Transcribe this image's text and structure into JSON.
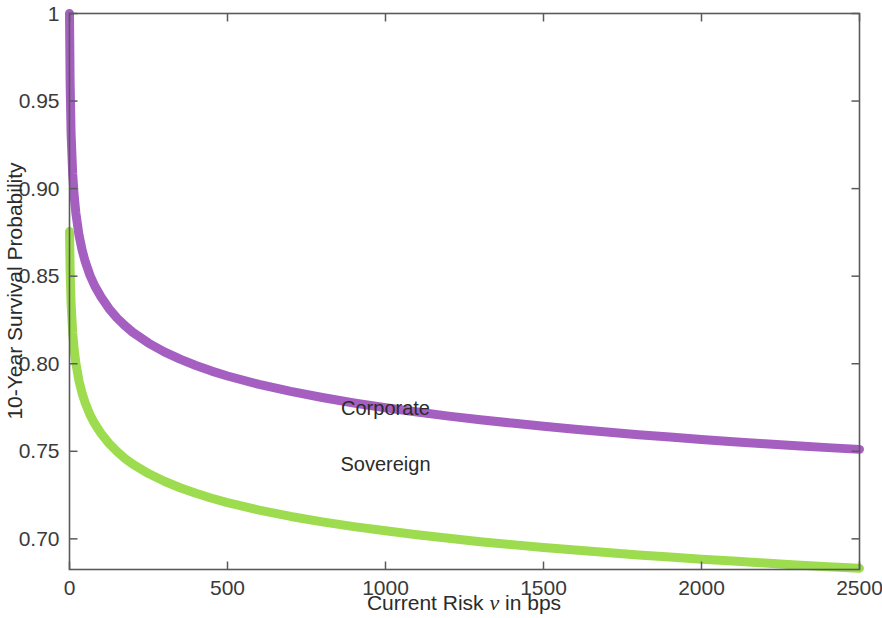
{
  "chart_data": {
    "type": "line",
    "title": "",
    "xlabel": "Current Risk ν in bps",
    "xlabel_prefix": "Current Risk ",
    "xlabel_symbol": "ν",
    "xlabel_suffix": " in bps",
    "ylabel": "10-Year Survival Probability",
    "xlim": [
      0,
      2500
    ],
    "ylim": [
      0.6825,
      1.0
    ],
    "xticks": [
      0,
      500,
      1000,
      1500,
      2000,
      2500
    ],
    "xtick_labels": [
      "0",
      "500",
      "1000",
      "1500",
      "2000",
      "2500"
    ],
    "yticks": [
      0.7,
      0.75,
      0.8,
      0.85,
      0.9,
      0.95,
      1.0
    ],
    "ytick_labels": [
      "0.70",
      "0.75",
      "0.80",
      "0.85",
      "0.90",
      "0.95",
      "1"
    ],
    "grid": false,
    "legend_position": "inline-annotations",
    "series": [
      {
        "name": "Corporate",
        "color": "#a55fc0",
        "label_x": 1000,
        "label_y": 0.7705,
        "x": [
          0,
          2,
          5,
          10,
          15,
          20,
          30,
          40,
          50,
          65,
          80,
          100,
          125,
          150,
          175,
          200,
          250,
          300,
          350,
          400,
          450,
          500,
          600,
          700,
          800,
          900,
          1000,
          1100,
          1200,
          1300,
          1400,
          1500,
          1600,
          1700,
          1800,
          1900,
          2000,
          2100,
          2200,
          2300,
          2400,
          2500
        ],
        "y": [
          1.0,
          0.9605,
          0.9315,
          0.9085,
          0.8955,
          0.8862,
          0.8735,
          0.8648,
          0.8582,
          0.8504,
          0.8444,
          0.8381,
          0.8315,
          0.8262,
          0.8218,
          0.818,
          0.8118,
          0.8068,
          0.8026,
          0.799,
          0.7958,
          0.793,
          0.7882,
          0.7842,
          0.7807,
          0.7776,
          0.7749,
          0.7724,
          0.7701,
          0.768,
          0.7661,
          0.7643,
          0.7626,
          0.761,
          0.7595,
          0.7581,
          0.7568,
          0.7555,
          0.7543,
          0.7532,
          0.7521,
          0.7511
        ]
      },
      {
        "name": "Sovereign",
        "color": "#9ddc4f",
        "label_x": 1000,
        "label_y": 0.7385,
        "x": [
          0,
          2,
          5,
          10,
          15,
          20,
          30,
          40,
          50,
          65,
          80,
          100,
          125,
          150,
          175,
          200,
          250,
          300,
          350,
          400,
          450,
          500,
          600,
          700,
          800,
          900,
          1000,
          1100,
          1200,
          1300,
          1400,
          1500,
          1600,
          1700,
          1800,
          1900,
          2000,
          2100,
          2200,
          2300,
          2400,
          2500
        ],
        "y": [
          0.8755,
          0.8532,
          0.8345,
          0.8178,
          0.8078,
          0.8005,
          0.7902,
          0.783,
          0.7775,
          0.7708,
          0.7657,
          0.7602,
          0.7545,
          0.7499,
          0.746,
          0.7427,
          0.7373,
          0.7329,
          0.7292,
          0.726,
          0.7232,
          0.7207,
          0.7164,
          0.7128,
          0.7097,
          0.707,
          0.7046,
          0.7023,
          0.7003,
          0.6984,
          0.6967,
          0.6951,
          0.6936,
          0.6922,
          0.6908,
          0.6896,
          0.6884,
          0.6873,
          0.6862,
          0.6851,
          0.6841,
          0.6832
        ]
      }
    ]
  },
  "figure": {
    "background_color": "#ffffff",
    "axis_color": "#5a5a5a"
  }
}
